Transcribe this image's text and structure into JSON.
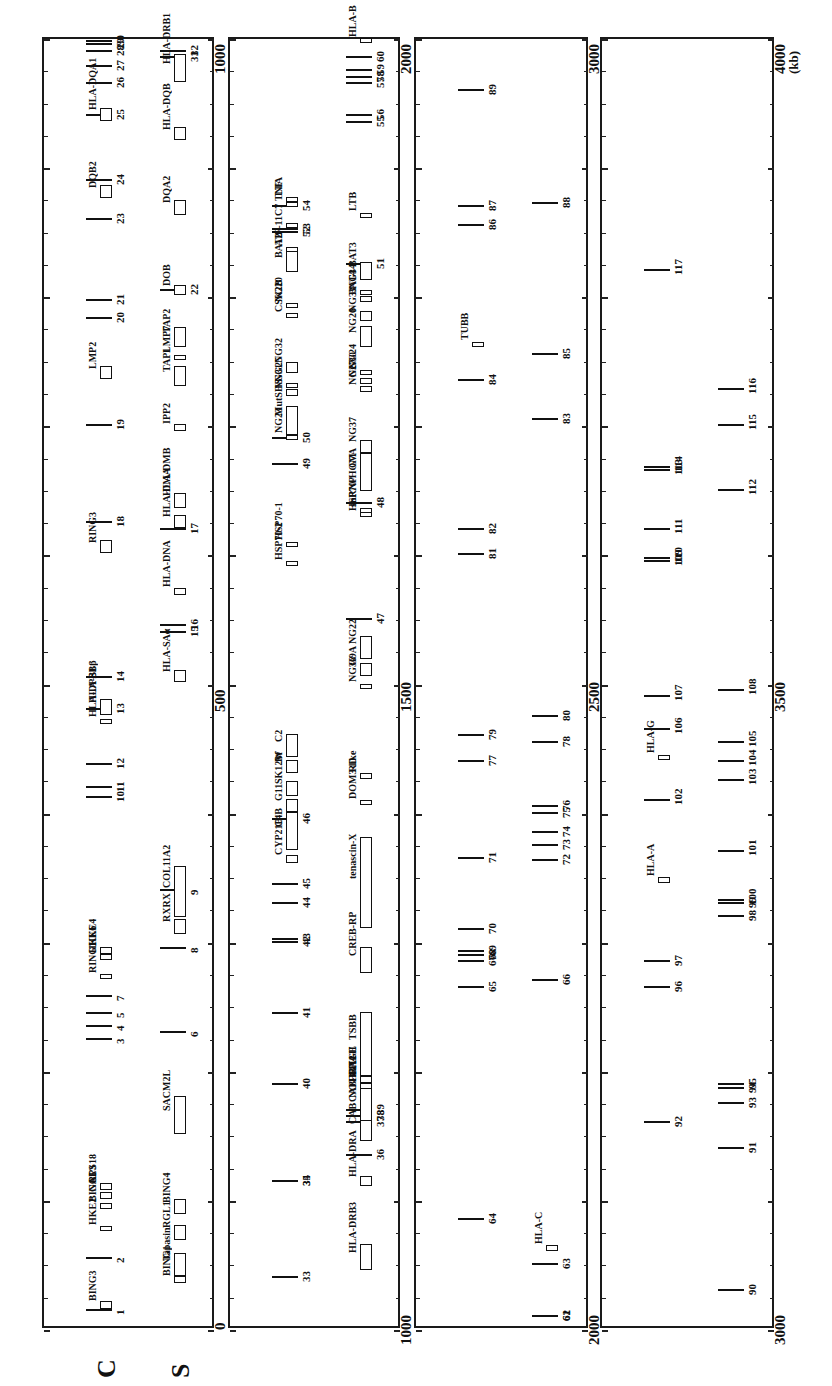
{
  "figure": {
    "orientation": "rotated -90deg; position increases upward within each panel",
    "units_label": "(kb)",
    "strand_labels": [
      "C",
      "S"
    ],
    "panels": [
      {
        "start": 0,
        "end": 1000,
        "start_label": "0",
        "mid_label": "500",
        "end_label": "1000"
      },
      {
        "start": 1000,
        "end": 2000,
        "start_label": "1000",
        "mid_label": "1500",
        "end_label": "2000"
      },
      {
        "start": 2000,
        "end": 3000,
        "start_label": "2000",
        "mid_label": "2500",
        "end_label": "3000"
      },
      {
        "start": 3000,
        "end": 4000,
        "start_label": "3000",
        "mid_label": "3500",
        "end_label": "4000"
      }
    ]
  },
  "marks": [
    {
      "id": "1",
      "kb": 15,
      "lane": "C"
    },
    {
      "id": "2",
      "kb": 55,
      "lane": "C"
    },
    {
      "id": "3",
      "kb": 225,
      "lane": "C"
    },
    {
      "id": "4",
      "kb": 235,
      "lane": "C"
    },
    {
      "id": "5",
      "kb": 245,
      "lane": "C"
    },
    {
      "id": "6",
      "kb": 230,
      "lane": "S"
    },
    {
      "id": "7",
      "kb": 258,
      "lane": "C"
    },
    {
      "id": "8",
      "kb": 295,
      "lane": "S"
    },
    {
      "id": "9",
      "kb": 340,
      "lane": "S"
    },
    {
      "id": "10",
      "kb": 412,
      "lane": "C"
    },
    {
      "id": "11",
      "kb": 420,
      "lane": "C"
    },
    {
      "id": "12",
      "kb": 438,
      "lane": "C"
    },
    {
      "id": "13",
      "kb": 480,
      "lane": "C"
    },
    {
      "id": "14",
      "kb": 505,
      "lane": "C"
    },
    {
      "id": "15",
      "kb": 540,
      "lane": "S"
    },
    {
      "id": "16",
      "kb": 545,
      "lane": "S"
    },
    {
      "id": "17",
      "kb": 620,
      "lane": "S"
    },
    {
      "id": "18",
      "kb": 625,
      "lane": "C"
    },
    {
      "id": "19",
      "kb": 700,
      "lane": "C"
    },
    {
      "id": "20",
      "kb": 783,
      "lane": "C"
    },
    {
      "id": "21",
      "kb": 797,
      "lane": "C"
    },
    {
      "id": "22",
      "kb": 805,
      "lane": "S"
    },
    {
      "id": "23",
      "kb": 860,
      "lane": "C"
    },
    {
      "id": "24",
      "kb": 890,
      "lane": "C"
    },
    {
      "id": "25",
      "kb": 940,
      "lane": "C"
    },
    {
      "id": "26",
      "kb": 965,
      "lane": "C"
    },
    {
      "id": "27",
      "kb": 978,
      "lane": "C"
    },
    {
      "id": "28",
      "kb": 990,
      "lane": "C"
    },
    {
      "id": "29",
      "kb": 995,
      "lane": "C"
    },
    {
      "id": "30",
      "kb": 998,
      "lane": "C"
    },
    {
      "id": "31",
      "kb": 985,
      "lane": "S"
    },
    {
      "id": "32",
      "kb": 990,
      "lane": "S"
    },
    {
      "id": "33",
      "kb": 1040,
      "lane": "C"
    },
    {
      "id": "34",
      "kb": 1115,
      "lane": "C"
    },
    {
      "id": "35",
      "kb": 1115,
      "lane": "C"
    },
    {
      "id": "36",
      "kb": 1135,
      "lane": "S"
    },
    {
      "id": "37",
      "kb": 1160,
      "lane": "S"
    },
    {
      "id": "38",
      "kb": 1165,
      "lane": "S"
    },
    {
      "id": "39",
      "kb": 1170,
      "lane": "S"
    },
    {
      "id": "40",
      "kb": 1190,
      "lane": "C"
    },
    {
      "id": "41",
      "kb": 1245,
      "lane": "C"
    },
    {
      "id": "42",
      "kb": 1300,
      "lane": "C"
    },
    {
      "id": "43",
      "kb": 1302,
      "lane": "C"
    },
    {
      "id": "44",
      "kb": 1330,
      "lane": "C"
    },
    {
      "id": "45",
      "kb": 1345,
      "lane": "C"
    },
    {
      "id": "46",
      "kb": 1395,
      "lane": "C"
    },
    {
      "id": "47",
      "kb": 1550,
      "lane": "S"
    },
    {
      "id": "48",
      "kb": 1640,
      "lane": "S"
    },
    {
      "id": "49",
      "kb": 1670,
      "lane": "C"
    },
    {
      "id": "50",
      "kb": 1690,
      "lane": "C"
    },
    {
      "id": "51",
      "kb": 1825,
      "lane": "S"
    },
    {
      "id": "52",
      "kb": 1850,
      "lane": "C"
    },
    {
      "id": "53",
      "kb": 1852,
      "lane": "C"
    },
    {
      "id": "54",
      "kb": 1870,
      "lane": "C"
    },
    {
      "id": "55",
      "kb": 1935,
      "lane": "S"
    },
    {
      "id": "56",
      "kb": 1940,
      "lane": "S"
    },
    {
      "id": "57",
      "kb": 1965,
      "lane": "S"
    },
    {
      "id": "58",
      "kb": 1970,
      "lane": "S"
    },
    {
      "id": "59",
      "kb": 1975,
      "lane": "S"
    },
    {
      "id": "60",
      "kb": 1985,
      "lane": "S"
    },
    {
      "id": "61",
      "kb": 2010,
      "lane": "S"
    },
    {
      "id": "62",
      "kb": 2010,
      "lane": "S"
    },
    {
      "id": "63",
      "kb": 2050,
      "lane": "S"
    },
    {
      "id": "64",
      "kb": 2085,
      "lane": "C"
    },
    {
      "id": "65",
      "kb": 2265,
      "lane": "C"
    },
    {
      "id": "66",
      "kb": 2270,
      "lane": "S"
    },
    {
      "id": "67",
      "kb": 2285,
      "lane": "C"
    },
    {
      "id": "68",
      "kb": 2290,
      "lane": "C"
    },
    {
      "id": "69",
      "kb": 2293,
      "lane": "C"
    },
    {
      "id": "70",
      "kb": 2310,
      "lane": "C"
    },
    {
      "id": "71",
      "kb": 2365,
      "lane": "C"
    },
    {
      "id": "72",
      "kb": 2363,
      "lane": "S"
    },
    {
      "id": "73",
      "kb": 2375,
      "lane": "S"
    },
    {
      "id": "74",
      "kb": 2385,
      "lane": "S"
    },
    {
      "id": "75",
      "kb": 2400,
      "lane": "S"
    },
    {
      "id": "76",
      "kb": 2405,
      "lane": "S"
    },
    {
      "id": "77",
      "kb": 2440,
      "lane": "C"
    },
    {
      "id": "78",
      "kb": 2455,
      "lane": "S"
    },
    {
      "id": "79",
      "kb": 2460,
      "lane": "C"
    },
    {
      "id": "80",
      "kb": 2475,
      "lane": "S"
    },
    {
      "id": "81",
      "kb": 2600,
      "lane": "C"
    },
    {
      "id": "82",
      "kb": 2620,
      "lane": "C"
    },
    {
      "id": "83",
      "kb": 2705,
      "lane": "S"
    },
    {
      "id": "84",
      "kb": 2735,
      "lane": "C"
    },
    {
      "id": "85",
      "kb": 2755,
      "lane": "S"
    },
    {
      "id": "86",
      "kb": 2855,
      "lane": "C"
    },
    {
      "id": "87",
      "kb": 2870,
      "lane": "C"
    },
    {
      "id": "88",
      "kb": 2872,
      "lane": "S"
    },
    {
      "id": "89",
      "kb": 2960,
      "lane": "C"
    },
    {
      "id": "90",
      "kb": 3030,
      "lane": "S"
    },
    {
      "id": "91",
      "kb": 3140,
      "lane": "S"
    },
    {
      "id": "92",
      "kb": 3160,
      "lane": "C"
    },
    {
      "id": "93",
      "kb": 3175,
      "lane": "S"
    },
    {
      "id": "94",
      "kb": 3187,
      "lane": "S"
    },
    {
      "id": "95",
      "kb": 3190,
      "lane": "S"
    },
    {
      "id": "96",
      "kb": 3265,
      "lane": "C"
    },
    {
      "id": "97",
      "kb": 3285,
      "lane": "C"
    },
    {
      "id": "98",
      "kb": 3320,
      "lane": "S"
    },
    {
      "id": "99",
      "kb": 3330,
      "lane": "S"
    },
    {
      "id": "100",
      "kb": 3332,
      "lane": "S"
    },
    {
      "id": "101",
      "kb": 3370,
      "lane": "S"
    },
    {
      "id": "102",
      "kb": 3410,
      "lane": "C"
    },
    {
      "id": "103",
      "kb": 3425,
      "lane": "S"
    },
    {
      "id": "104",
      "kb": 3440,
      "lane": "S"
    },
    {
      "id": "105",
      "kb": 3455,
      "lane": "S"
    },
    {
      "id": "106",
      "kb": 3465,
      "lane": "C"
    },
    {
      "id": "107",
      "kb": 3490,
      "lane": "C"
    },
    {
      "id": "108",
      "kb": 3495,
      "lane": "S"
    },
    {
      "id": "109",
      "kb": 3595,
      "lane": "C"
    },
    {
      "id": "110",
      "kb": 3597,
      "lane": "C"
    },
    {
      "id": "111",
      "kb": 3620,
      "lane": "C"
    },
    {
      "id": "112",
      "kb": 3650,
      "lane": "S"
    },
    {
      "id": "113",
      "kb": 3665,
      "lane": "C"
    },
    {
      "id": "114",
      "kb": 3668,
      "lane": "C"
    },
    {
      "id": "115",
      "kb": 3700,
      "lane": "S"
    },
    {
      "id": "116",
      "kb": 3728,
      "lane": "S"
    },
    {
      "id": "117",
      "kb": 3820,
      "lane": "C"
    }
  ],
  "genes": [
    {
      "name": "BING3",
      "kb": 15,
      "len": 6,
      "lane": "C"
    },
    {
      "name": "BING1",
      "kb": 35,
      "len": 5,
      "lane": "S"
    },
    {
      "name": "Tapasin",
      "kb": 40,
      "len": 18,
      "lane": "S"
    },
    {
      "name": "RGL1",
      "kb": 68,
      "len": 12,
      "lane": "S"
    },
    {
      "name": "HKE2",
      "kb": 75,
      "len": 4,
      "lane": "C"
    },
    {
      "name": "BING4",
      "kb": 88,
      "len": 12,
      "lane": "S"
    },
    {
      "name": "BING5",
      "kb": 92,
      "len": 5,
      "lane": "C"
    },
    {
      "name": "GAL3",
      "kb": 100,
      "len": 5,
      "lane": "C"
    },
    {
      "name": "RPS18",
      "kb": 107,
      "len": 5,
      "lane": "C"
    },
    {
      "name": "SACM2L",
      "kb": 150,
      "len": 30,
      "lane": "S"
    },
    {
      "name": "RING1",
      "kb": 270,
      "len": 4,
      "lane": "C"
    },
    {
      "name": "HKE6",
      "kb": 285,
      "len": 5,
      "lane": "C"
    },
    {
      "name": "HKE4",
      "kb": 290,
      "len": 5,
      "lane": "C"
    },
    {
      "name": "RXRX",
      "kb": 305,
      "len": 12,
      "lane": "S"
    },
    {
      "name": "COL11A2",
      "kb": 318,
      "len": 40,
      "lane": "S"
    },
    {
      "name": "HLA-DPB1",
      "kb": 468,
      "len": 4,
      "lane": "C"
    },
    {
      "name": "HLA-SBβ",
      "kb": 475,
      "len": 12,
      "lane": "C"
    },
    {
      "name": "HLA-SAα",
      "kb": 500,
      "len": 10,
      "lane": "S"
    },
    {
      "name": "HLA-DNA",
      "kb": 568,
      "len": 5,
      "lane": "S"
    },
    {
      "name": "RING3",
      "kb": 600,
      "len": 10,
      "lane": "C"
    },
    {
      "name": "HLA-DMA",
      "kb": 620,
      "len": 10,
      "lane": "S"
    },
    {
      "name": "HLA-DMB",
      "kb": 635,
      "len": 12,
      "lane": "S"
    },
    {
      "name": "IPP2",
      "kb": 695,
      "len": 5,
      "lane": "S"
    },
    {
      "name": "LMP2",
      "kb": 735,
      "len": 10,
      "lane": "C"
    },
    {
      "name": "TAP1",
      "kb": 730,
      "len": 15,
      "lane": "S"
    },
    {
      "name": "LMP7",
      "kb": 750,
      "len": 4,
      "lane": "S"
    },
    {
      "name": "TAP2",
      "kb": 760,
      "len": 15,
      "lane": "S"
    },
    {
      "name": "DOB",
      "kb": 800,
      "len": 8,
      "lane": "S"
    },
    {
      "name": "DQA2",
      "kb": 862,
      "len": 12,
      "lane": "S"
    },
    {
      "name": "DQB2",
      "kb": 875,
      "len": 10,
      "lane": "C"
    },
    {
      "name": "HLA-DQB",
      "kb": 920,
      "len": 10,
      "lane": "S"
    },
    {
      "name": "HLA-DQA1",
      "kb": 935,
      "len": 10,
      "lane": "C"
    },
    {
      "name": "HLA-DRB1",
      "kb": 965,
      "len": 22,
      "lane": "S"
    },
    {
      "name": "HLA-DRB3",
      "kb": 1045,
      "len": 20,
      "lane": "S"
    },
    {
      "name": "HLA-DRA",
      "kb": 1110,
      "len": 8,
      "lane": "S"
    },
    {
      "name": "CAB",
      "kb": 1145,
      "len": 20,
      "lane": "S"
    },
    {
      "name": "CAB-BTL-II",
      "kb": 1170,
      "len": 4,
      "lane": "S"
    },
    {
      "name": "TSBB",
      "kb": 1195,
      "len": 50,
      "lane": "S"
    },
    {
      "name": "NOTCH4",
      "kb": 1160,
      "len": 30,
      "lane": "S"
    },
    {
      "name": "HBX2",
      "kb": 1185,
      "len": 5,
      "lane": "S"
    },
    {
      "name": "RAGE",
      "kb": 1190,
      "len": 5,
      "lane": "S"
    },
    {
      "name": "CREB-RP",
      "kb": 1275,
      "len": 20,
      "lane": "S"
    },
    {
      "name": "tenascin-X",
      "kb": 1310,
      "len": 70,
      "lane": "S"
    },
    {
      "name": "CYP21B",
      "kb": 1360,
      "len": 6,
      "lane": "C"
    },
    {
      "name": "C4B",
      "kb": 1370,
      "len": 30,
      "lane": "C"
    },
    {
      "name": "G11",
      "kb": 1400,
      "len": 10,
      "lane": "C"
    },
    {
      "name": "SK12W",
      "kb": 1412,
      "len": 12,
      "lane": "C"
    },
    {
      "name": "Bf",
      "kb": 1430,
      "len": 10,
      "lane": "C"
    },
    {
      "name": "C2",
      "kb": 1442,
      "len": 18,
      "lane": "C"
    },
    {
      "name": "DOM3-like",
      "kb": 1405,
      "len": 4,
      "lane": "S"
    },
    {
      "name": "RD",
      "kb": 1425,
      "len": 5,
      "lane": "S"
    },
    {
      "name": "NG36",
      "kb": 1495,
      "len": 4,
      "lane": "S"
    },
    {
      "name": "G9A",
      "kb": 1505,
      "len": 10,
      "lane": "S"
    },
    {
      "name": "NG22",
      "kb": 1518,
      "len": 18,
      "lane": "S"
    },
    {
      "name": "HSP70-2",
      "kb": 1590,
      "len": 4,
      "lane": "C"
    },
    {
      "name": "HSP70-1",
      "kb": 1605,
      "len": 4,
      "lane": "C"
    },
    {
      "name": "HSP70-HOM",
      "kb": 1628,
      "len": 4,
      "lane": "S"
    },
    {
      "name": "snRNP",
      "kb": 1631,
      "len": 4,
      "lane": "S"
    },
    {
      "name": "G7A",
      "kb": 1648,
      "len": 30,
      "lane": "S"
    },
    {
      "name": "NG37",
      "kb": 1678,
      "len": 10,
      "lane": "S"
    },
    {
      "name": "NG23",
      "kb": 1688,
      "len": 4,
      "lane": "C"
    },
    {
      "name": "MutSHS",
      "kb": 1692,
      "len": 22,
      "lane": "C"
    },
    {
      "name": "NG27",
      "kb": 1725,
      "len": 5,
      "lane": "S"
    },
    {
      "name": "NG30",
      "kb": 1731,
      "len": 5,
      "lane": "S"
    },
    {
      "name": "NG24",
      "kb": 1738,
      "len": 4,
      "lane": "S"
    },
    {
      "name": "NG31",
      "kb": 1722,
      "len": 5,
      "lane": "C"
    },
    {
      "name": "NG25",
      "kb": 1728,
      "len": 4,
      "lane": "C"
    },
    {
      "name": "NG32",
      "kb": 1740,
      "len": 8,
      "lane": "C"
    },
    {
      "name": "NG26",
      "kb": 1760,
      "len": 16,
      "lane": "S"
    },
    {
      "name": "NG33",
      "kb": 1780,
      "len": 8,
      "lane": "S"
    },
    {
      "name": "BAT4",
      "kb": 1795,
      "len": 4,
      "lane": "S"
    },
    {
      "name": "NG34",
      "kb": 1800,
      "len": 4,
      "lane": "S"
    },
    {
      "name": "BAT3",
      "kb": 1812,
      "len": 14,
      "lane": "S"
    },
    {
      "name": "CSK2B",
      "kb": 1782,
      "len": 4,
      "lane": "C"
    },
    {
      "name": "NG20",
      "kb": 1790,
      "len": 4,
      "lane": "C"
    },
    {
      "name": "BAT2",
      "kb": 1818,
      "len": 16,
      "lane": "C"
    },
    {
      "name": "AIF-1",
      "kb": 1835,
      "len": 2,
      "lane": "C"
    },
    {
      "name": "1C7",
      "kb": 1852,
      "len": 4,
      "lane": "C"
    },
    {
      "name": "TNF",
      "kb": 1868,
      "len": 4,
      "lane": "C"
    },
    {
      "name": "LTA",
      "kb": 1872,
      "len": 4,
      "lane": "C"
    },
    {
      "name": "LTB",
      "kb": 1860,
      "len": 4,
      "lane": "S"
    },
    {
      "name": "HLA-B",
      "kb": 1995,
      "len": 4,
      "lane": "S"
    },
    {
      "name": "HLA-C",
      "kb": 2060,
      "len": 4,
      "lane": "S"
    },
    {
      "name": "TUBB",
      "kb": 2760,
      "len": 4,
      "lane": "C"
    },
    {
      "name": "HLA-A",
      "kb": 3345,
      "len": 4,
      "lane": "C"
    },
    {
      "name": "HLA-G",
      "kb": 3440,
      "len": 4,
      "lane": "C"
    }
  ]
}
